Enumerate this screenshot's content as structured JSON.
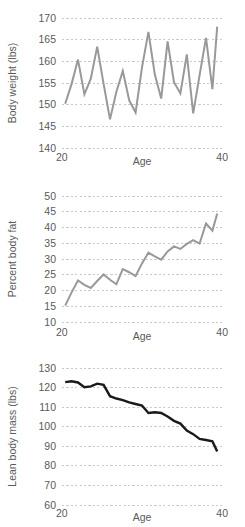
{
  "figure": {
    "panel_count": 3,
    "background_color": "#ffffff"
  },
  "chart_data": [
    {
      "type": "line",
      "title": "",
      "xlabel": "Age",
      "ylabel": "Body weight (lbs)",
      "xlim": [
        20,
        40
      ],
      "ylim": [
        140,
        170
      ],
      "xticks": [
        20,
        40
      ],
      "xtick_labels": [
        "20",
        "40"
      ],
      "yticks": [
        140,
        145,
        150,
        155,
        160,
        165,
        170
      ],
      "ytick_labels": [
        "140",
        "145",
        "150",
        "155",
        "160",
        "165",
        "170"
      ],
      "grid": true,
      "legend": "none",
      "line_color": "#999999",
      "line_width": 2.0,
      "x": [
        20.4,
        21.2,
        22.0,
        22.8,
        23.6,
        24.4,
        25.2,
        26.0,
        26.8,
        27.6,
        28.4,
        29.2,
        30.0,
        30.8,
        31.6,
        32.4,
        33.2,
        34.0,
        34.8,
        35.6,
        36.4,
        37.2,
        38.0,
        38.8,
        39.4
      ],
      "y": [
        150.2,
        154.8,
        160.4,
        152.4,
        156.0,
        163.4,
        154.8,
        146.6,
        153.0,
        157.8,
        151.0,
        148.2,
        158.6,
        166.8,
        157.0,
        151.4,
        164.6,
        155.2,
        152.6,
        161.6,
        148.0,
        156.8,
        165.4,
        153.6,
        168.0
      ]
    },
    {
      "type": "line",
      "title": "",
      "xlabel": "Age",
      "ylabel": "Percent body fat",
      "xlim": [
        20,
        40
      ],
      "ylim": [
        10,
        50
      ],
      "xticks": [
        20,
        40
      ],
      "xtick_labels": [
        "20",
        "40"
      ],
      "yticks": [
        10,
        15,
        20,
        25,
        30,
        35,
        40,
        45,
        50
      ],
      "ytick_labels": [
        "10",
        "15",
        "20",
        "25",
        "30",
        "35",
        "40",
        "45",
        "50"
      ],
      "grid": true,
      "legend": "none",
      "line_color": "#999999",
      "line_width": 2.0,
      "x": [
        20.4,
        21.2,
        22.0,
        22.8,
        23.6,
        24.4,
        25.2,
        26.0,
        26.8,
        27.6,
        28.4,
        29.2,
        30.0,
        30.8,
        31.6,
        32.4,
        33.2,
        34.0,
        34.8,
        35.6,
        36.4,
        37.2,
        38.0,
        38.8,
        39.4
      ],
      "y": [
        15.2,
        19.4,
        23.2,
        21.8,
        20.8,
        23.0,
        25.1,
        23.4,
        22.0,
        26.8,
        25.8,
        24.6,
        28.6,
        32.0,
        30.8,
        29.8,
        32.4,
        34.0,
        33.2,
        34.8,
        36.0,
        34.9,
        41.3,
        39.0,
        44.4
      ]
    },
    {
      "type": "line",
      "title": "",
      "xlabel": "Age",
      "ylabel": "Lean body mass (lbs)",
      "xlim": [
        20,
        40
      ],
      "ylim": [
        60,
        130
      ],
      "xticks": [
        20,
        40
      ],
      "xtick_labels": [
        "20",
        "40"
      ],
      "yticks": [
        60,
        70,
        80,
        90,
        100,
        110,
        120,
        130
      ],
      "ytick_labels": [
        "60",
        "70",
        "80",
        "90",
        "100",
        "110",
        "120",
        "130"
      ],
      "grid": true,
      "legend": "none",
      "line_color": "#1a1a1a",
      "line_width": 2.4,
      "x": [
        20.4,
        21.2,
        22.0,
        22.8,
        23.6,
        24.4,
        25.2,
        26.0,
        26.8,
        27.6,
        28.4,
        29.2,
        30.0,
        30.8,
        31.6,
        32.4,
        33.2,
        34.0,
        34.8,
        35.6,
        36.4,
        37.2,
        38.0,
        38.8,
        39.4
      ],
      "y": [
        122.8,
        123.2,
        122.6,
        120.2,
        120.6,
        122.0,
        121.4,
        115.6,
        114.4,
        113.6,
        112.4,
        111.6,
        110.8,
        107.0,
        107.4,
        107.0,
        105.2,
        103.0,
        101.6,
        98.0,
        96.2,
        93.8,
        93.2,
        92.6,
        87.4
      ]
    }
  ]
}
